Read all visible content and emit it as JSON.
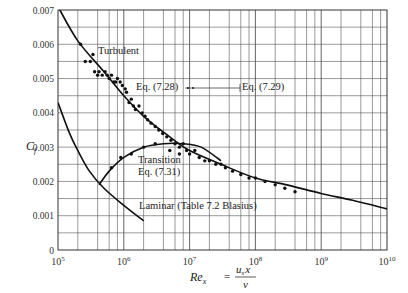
{
  "chart_data": {
    "type": "scatter",
    "title": "",
    "xlabel": "Re_x = u_s x / v",
    "ylabel": "C_f",
    "xscale": "log",
    "xlim": [
      100000,
      10000000000
    ],
    "ylim": [
      0,
      0.007
    ],
    "grid": true,
    "legend": "none (inline annotations)",
    "x_tick_labels": [
      "10^5",
      "10^6",
      "10^7",
      "10^8",
      "10^9",
      "10^10"
    ],
    "y_tick_labels": [
      "0",
      "0.001",
      "0.002",
      "0.003",
      "0.004",
      "0.005",
      "0.006",
      "0.007"
    ],
    "annotations": [
      "Turbulent",
      "Eq. (7.28)",
      "Eq. (7.29)",
      "Transition",
      "Eq. (7.31)",
      "Laminar (Table 7.2 Blasius)"
    ],
    "series": [
      {
        "name": "Turbulent (Eq. 7.28 / 7.29)",
        "kind": "line",
        "points": [
          [
            100000,
            0.0071
          ],
          [
            200000,
            0.0061
          ],
          [
            500000,
            0.0052
          ],
          [
            1000000,
            0.0045
          ],
          [
            2000000,
            0.0039
          ],
          [
            5000000,
            0.0033
          ],
          [
            10000000,
            0.0029
          ],
          [
            30000000,
            0.0025
          ],
          [
            100000000,
            0.0021
          ],
          [
            300000000,
            0.0019
          ],
          [
            1000000000,
            0.00165
          ],
          [
            3000000000,
            0.00145
          ],
          [
            10000000000,
            0.0012
          ]
        ]
      },
      {
        "name": "Laminar (Table 7.2 Blasius)",
        "kind": "line",
        "points": [
          [
            100000,
            0.0043
          ],
          [
            150000,
            0.0034
          ],
          [
            200000,
            0.0029
          ],
          [
            300000,
            0.0023
          ],
          [
            500000,
            0.0018
          ],
          [
            1000000,
            0.0013
          ],
          [
            2000000,
            0.00085
          ]
        ]
      },
      {
        "name": "Transition (Eq. 7.31)",
        "kind": "line",
        "points": [
          [
            420000,
            0.0019
          ],
          [
            600000,
            0.0023
          ],
          [
            1000000,
            0.0027
          ],
          [
            2000000,
            0.003
          ],
          [
            4000000,
            0.0031
          ],
          [
            8000000,
            0.0031
          ],
          [
            15000000,
            0.003
          ],
          [
            30000000,
            0.0026
          ]
        ]
      },
      {
        "name": "Experimental data",
        "kind": "scatter",
        "points": [
          [
            220000,
            0.006
          ],
          [
            260000,
            0.0055
          ],
          [
            310000,
            0.0055
          ],
          [
            340000,
            0.0057
          ],
          [
            360000,
            0.0052
          ],
          [
            400000,
            0.0051
          ],
          [
            420000,
            0.0052
          ],
          [
            470000,
            0.0051
          ],
          [
            520000,
            0.0052
          ],
          [
            560000,
            0.0051
          ],
          [
            600000,
            0.005
          ],
          [
            650000,
            0.0051
          ],
          [
            700000,
            0.0049
          ],
          [
            750000,
            0.0049
          ],
          [
            800000,
            0.005
          ],
          [
            880000,
            0.0049
          ],
          [
            950000,
            0.0048
          ],
          [
            1050000,
            0.0047
          ],
          [
            1100000,
            0.0046
          ],
          [
            1200000,
            0.0043
          ],
          [
            1300000,
            0.0044
          ],
          [
            1400000,
            0.0042
          ],
          [
            1500000,
            0.0041
          ],
          [
            1700000,
            0.0042
          ],
          [
            1900000,
            0.004
          ],
          [
            2100000,
            0.0039
          ],
          [
            2300000,
            0.0038
          ],
          [
            2600000,
            0.0037
          ],
          [
            3000000,
            0.0036
          ],
          [
            3400000,
            0.0035
          ],
          [
            3900000,
            0.0034
          ],
          [
            4500000,
            0.0033
          ],
          [
            5200000,
            0.0032
          ],
          [
            6000000,
            0.0031
          ],
          [
            7000000,
            0.003
          ],
          [
            8000000,
            0.0031
          ],
          [
            9000000,
            0.0029
          ],
          [
            10000000,
            0.0028
          ],
          [
            12000000,
            0.0029
          ],
          [
            14000000,
            0.0027
          ],
          [
            17000000,
            0.0026
          ],
          [
            20000000,
            0.0026
          ],
          [
            25000000,
            0.0025
          ],
          [
            30000000,
            0.0025
          ],
          [
            35000000,
            0.0024
          ],
          [
            45000000,
            0.0023
          ],
          [
            60000000,
            0.0022
          ],
          [
            80000000,
            0.0021
          ],
          [
            100000000,
            0.0021
          ],
          [
            140000000,
            0.002
          ],
          [
            200000000,
            0.0019
          ],
          [
            280000000,
            0.0018
          ],
          [
            400000000,
            0.0017
          ],
          [
            1100000000,
            0.0042
          ],
          [
            650000,
            0.0024
          ],
          [
            900000,
            0.0027
          ],
          [
            1300000,
            0.0028
          ],
          [
            2000000,
            0.003
          ],
          [
            3000000,
            0.0031
          ],
          [
            5000000,
            0.0029
          ],
          [
            7000000,
            0.0028
          ]
        ]
      }
    ]
  },
  "labels": {
    "y_axis": "C",
    "y_axis_sub": "f",
    "x_axis_main": "Re",
    "x_axis_sub": "x",
    "x_axis_eq": "=",
    "x_axis_num": "u",
    "x_axis_num_sub": "s",
    "x_axis_num_x": "x",
    "x_axis_den": "v"
  }
}
